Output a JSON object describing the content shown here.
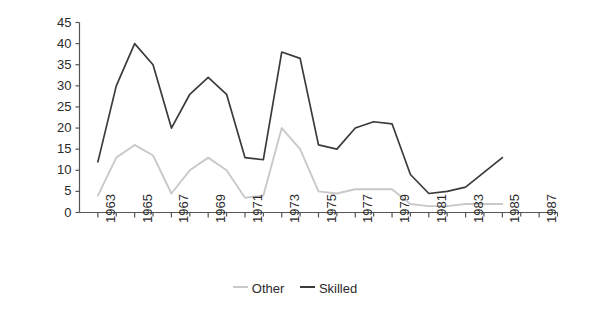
{
  "chart_data": {
    "type": "line",
    "title": "",
    "xlabel": "",
    "ylabel": "Firms reporting shortage (%)",
    "ylim": [
      0,
      45
    ],
    "yticks": [
      0,
      5,
      10,
      15,
      20,
      25,
      30,
      35,
      40,
      45
    ],
    "xlim": [
      1962,
      1988
    ],
    "xticks": [
      1963,
      1965,
      1967,
      1969,
      1971,
      1973,
      1975,
      1977,
      1979,
      1981,
      1983,
      1985,
      1987
    ],
    "xtick_labels": [
      "1963",
      "1965",
      "1967",
      "1969",
      "1971",
      "1973",
      "1975",
      "1977",
      "1979",
      "1981",
      "1983",
      "1985",
      "1987"
    ],
    "minor_xticks_every": 1,
    "grid": false,
    "legend_position": "bottom-center",
    "x": [
      1963,
      1964,
      1965,
      1966,
      1967,
      1968,
      1969,
      1970,
      1971,
      1972,
      1973,
      1974,
      1975,
      1976,
      1977,
      1978,
      1979,
      1980,
      1981,
      1982,
      1983,
      1984,
      1985
    ],
    "series": [
      {
        "name": "Other",
        "color": "#c9c9c9",
        "values": [
          4,
          13,
          16,
          13.5,
          4.5,
          10,
          13,
          10,
          3.5,
          4,
          20,
          15,
          5,
          4.5,
          5.5,
          5.5,
          5.5,
          2,
          1.5,
          1.5,
          2,
          2,
          2
        ]
      },
      {
        "name": "Skilled",
        "color": "#3b3b3b",
        "values": [
          12,
          30,
          40,
          35,
          20,
          28,
          32,
          28,
          13,
          12.5,
          38,
          36.5,
          16,
          15,
          20,
          21.5,
          21,
          9,
          4.5,
          5,
          6,
          9.5,
          13
        ]
      }
    ]
  },
  "axes": {
    "axis_color": "#555555",
    "tick_color": "#555555",
    "background": "#ffffff"
  },
  "legend": {
    "entries": [
      {
        "label": "Other",
        "color": "#c9c9c9"
      },
      {
        "label": "Skilled",
        "color": "#3b3b3b"
      }
    ]
  }
}
